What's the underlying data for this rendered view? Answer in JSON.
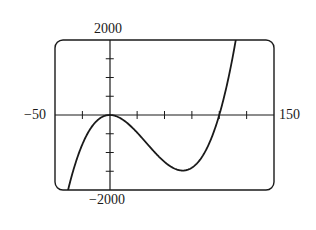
{
  "chart_data": {
    "type": "line",
    "title": "",
    "xlabel": "",
    "ylabel": "",
    "xlim": [
      -50,
      150
    ],
    "ylim": [
      -2000,
      2000
    ],
    "grid": false,
    "legend": null,
    "x_tick_interval": 25,
    "y_tick_interval": 500,
    "tick_labels": {
      "x_min": "−50",
      "x_max": "150",
      "y_min": "−2000",
      "y_max": "2000"
    },
    "series": [
      {
        "name": "f(x) = x^3/100 - x^2",
        "x": [
          -50,
          -36.6,
          -25,
          0,
          25,
          50,
          66.7,
          75,
          100,
          113.3,
          150
        ],
        "y": [
          -3750,
          -1830,
          -781,
          0,
          -469,
          -1250,
          -1481,
          -1406,
          0,
          2000,
          11250
        ]
      }
    ],
    "annotations": []
  },
  "labels": {
    "y_max": "2000",
    "y_min": "−2000",
    "x_min": "−50",
    "x_max": "150"
  },
  "colors": {
    "line": "#1a1a1a",
    "frame": "#1a1a1a",
    "background": "#ffffff"
  }
}
